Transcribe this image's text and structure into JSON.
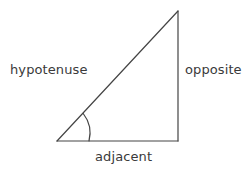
{
  "figure": {
    "kind": "right-triangle-trigonometry-diagram",
    "background_color": "#ffffff",
    "stroke_color": "#444444",
    "text_color": "#3a3a3a",
    "stroke_width": 1.2,
    "width": 248,
    "height": 170
  },
  "labels": {
    "hypotenuse": "hypotenuse",
    "opposite": "opposite",
    "adjacent": "adjacent"
  },
  "geometry": {
    "vertex_angle": {
      "x": 57,
      "y": 141
    },
    "vertex_right": {
      "x": 178,
      "y": 141
    },
    "vertex_apex": {
      "x": 178,
      "y": 11
    },
    "angle_arc": {
      "radius": 32,
      "start": {
        "x": 89,
        "y": 141
      },
      "end": {
        "x": 83.2,
        "y": 113.5
      }
    }
  }
}
